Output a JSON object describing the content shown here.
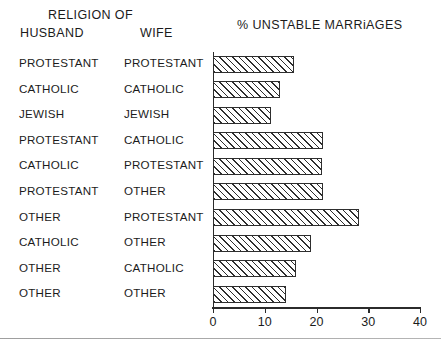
{
  "headers": {
    "religion_of": "RELIGION OF",
    "husband": "HUSBAND",
    "wife": "WIFE",
    "chart_title": "% UNSTABLE MARRiAGES"
  },
  "axis": {
    "ticks": [
      "0",
      "10",
      "20",
      "30",
      "40"
    ]
  },
  "chart_data": {
    "type": "bar",
    "orientation": "horizontal",
    "title": "% UNSTABLE MARRiAGES",
    "xlabel": "",
    "ylabel": "",
    "xlim": [
      0,
      40
    ],
    "grid": false,
    "legend": false,
    "column_headers": [
      "HUSBAND",
      "WIFE"
    ],
    "group_header": "RELIGION OF",
    "categories": [
      "PROTESTANT / PROTESTANT",
      "CATHOLIC / CATHOLIC",
      "JEWISH / JEWISH",
      "PROTESTANT / CATHOLIC",
      "CATHOLIC / PROTESTANT",
      "PROTESTANT / OTHER",
      "OTHER / PROTESTANT",
      "CATHOLIC / OTHER",
      "OTHER / CATHOLIC",
      "OTHER / OTHER"
    ],
    "values": [
      15.6,
      12.9,
      11.3,
      21.3,
      21.0,
      21.2,
      28.3,
      19.0,
      16.0,
      14.2
    ],
    "rows": [
      {
        "husband": "PROTESTANT",
        "wife": "PROTESTANT",
        "value": 15.6
      },
      {
        "husband": "CATHOLIC",
        "wife": "CATHOLIC",
        "value": 12.9
      },
      {
        "husband": "JEWISH",
        "wife": "JEWISH",
        "value": 11.3
      },
      {
        "husband": "PROTESTANT",
        "wife": "CATHOLIC",
        "value": 21.3
      },
      {
        "husband": "CATHOLIC",
        "wife": "PROTESTANT",
        "value": 21.0
      },
      {
        "husband": "PROTESTANT",
        "wife": "OTHER",
        "value": 21.2
      },
      {
        "husband": "OTHER",
        "wife": "PROTESTANT",
        "value": 28.3
      },
      {
        "husband": "CATHOLIC",
        "wife": "OTHER",
        "value": 19.0
      },
      {
        "husband": "OTHER",
        "wife": "CATHOLIC",
        "value": 16.0
      },
      {
        "husband": "OTHER",
        "wife": "OTHER",
        "value": 14.2
      }
    ]
  }
}
